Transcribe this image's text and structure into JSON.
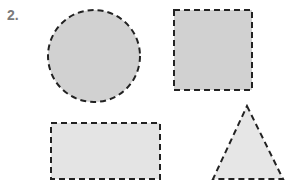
{
  "problem": {
    "number_label": "2."
  },
  "shapes": [
    {
      "type": "circle",
      "cx": 94,
      "cy": 56,
      "r": 46,
      "fill": "#d1d1d1",
      "stroke": "#222222",
      "dash": "6,4"
    },
    {
      "type": "square",
      "x": 174,
      "y": 10,
      "width": 78,
      "height": 80,
      "fill": "#d1d1d1",
      "stroke": "#222222",
      "dash": "6,4"
    },
    {
      "type": "rectangle",
      "x": 51,
      "y": 123,
      "width": 109,
      "height": 56,
      "fill": "#e4e4e4",
      "stroke": "#222222",
      "dash": "6,4"
    },
    {
      "type": "triangle",
      "points": "247,106 283,179 213,179",
      "fill": "#e6e6e6",
      "stroke": "#222222",
      "dash": "6,4"
    }
  ]
}
